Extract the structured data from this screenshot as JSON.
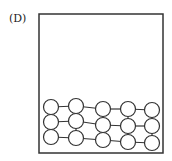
{
  "label": "(D)",
  "container": {
    "x": 39,
    "y": 14,
    "width": 124,
    "height": 139,
    "stroke": "#333333"
  },
  "particle_radius": 7.5,
  "particles": {
    "columns": [
      {
        "x": 51,
        "rows": [
          107,
          122,
          137
        ]
      },
      {
        "x": 76,
        "rows": [
          106,
          121,
          138
        ]
      },
      {
        "x": 103,
        "rows": [
          109,
          125,
          140
        ]
      },
      {
        "x": 128,
        "rows": [
          109,
          126,
          142
        ]
      },
      {
        "x": 152,
        "rows": [
          110,
          126,
          143
        ]
      }
    ]
  }
}
